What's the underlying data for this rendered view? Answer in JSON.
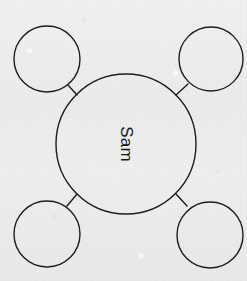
{
  "canvas": {
    "width": 247,
    "height": 281,
    "background_color": "#eeeeee",
    "medium": "hand-drawn on textured paper"
  },
  "diagram": {
    "type": "bubble-mind-map",
    "stroke_color": "#1a1a1a",
    "stroke_width": 1.4,
    "fill": "none",
    "center_node": {
      "id": "center",
      "label": "Sam",
      "label_rotation_degrees": 90,
      "cx": 126,
      "cy": 144,
      "r": 70
    },
    "satellite_nodes": [
      {
        "id": "top-left",
        "label": "",
        "cx": 47,
        "cy": 59,
        "r": 33
      },
      {
        "id": "top-right",
        "label": "",
        "cx": 211,
        "cy": 59,
        "r": 32
      },
      {
        "id": "bottom-left",
        "label": "",
        "cx": 47,
        "cy": 234,
        "r": 33
      },
      {
        "id": "bottom-right",
        "label": "",
        "cx": 210,
        "cy": 235,
        "r": 33
      }
    ],
    "connectors": [
      {
        "id": "center-to-top-left",
        "from": "center",
        "to": "top-left",
        "x1": 77,
        "y1": 95,
        "x2": 68,
        "y2": 85
      },
      {
        "id": "center-to-top-right",
        "from": "center",
        "to": "top-right",
        "x1": 176,
        "y1": 95,
        "x2": 188,
        "y2": 84
      },
      {
        "id": "center-to-bottom-left",
        "from": "center",
        "to": "bottom-left",
        "x1": 77,
        "y1": 194,
        "x2": 67,
        "y2": 206
      },
      {
        "id": "center-to-bottom-right",
        "from": "center",
        "to": "bottom-right",
        "x1": 176,
        "y1": 194,
        "x2": 187,
        "y2": 206
      }
    ]
  }
}
